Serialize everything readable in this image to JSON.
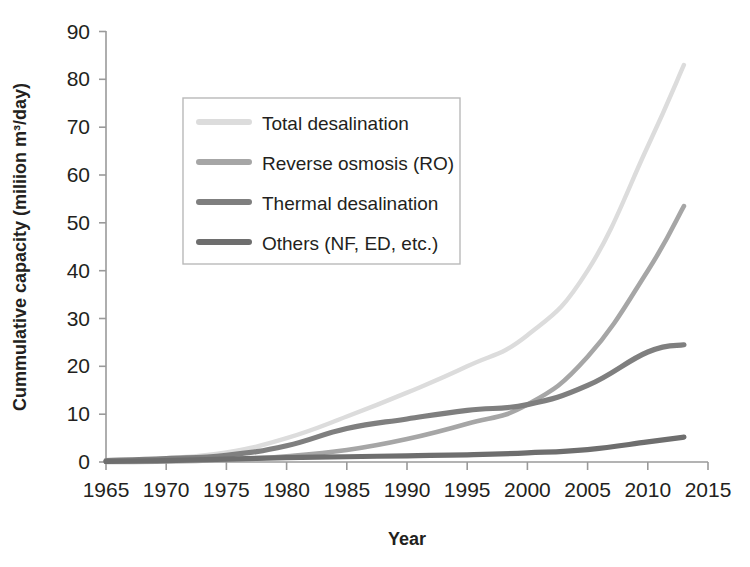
{
  "chart_data": {
    "type": "line",
    "title": "",
    "xlabel": "Year",
    "ylabel": "Cummulative capacity (miliion m³/day)",
    "xlim": [
      1965,
      2015
    ],
    "ylim": [
      0,
      90
    ],
    "x_ticks": [
      "1965",
      "1970",
      "1975",
      "1980",
      "1985",
      "1990",
      "1995",
      "2000",
      "2005",
      "2010",
      "2015"
    ],
    "y_ticks": [
      "0",
      "10",
      "20",
      "30",
      "40",
      "50",
      "60",
      "70",
      "80",
      "90"
    ],
    "grid": false,
    "legend_position": "upper-left-inside",
    "x": [
      1965,
      1970,
      1975,
      1980,
      1985,
      1990,
      1995,
      2000,
      2005,
      2010,
      2013
    ],
    "series": [
      {
        "name": "Total desalination",
        "color": "#dcdcdc",
        "values": [
          0.3,
          0.8,
          2.0,
          5.0,
          9.5,
          14.5,
          20.0,
          26.5,
          40.0,
          66.0,
          83.0
        ]
      },
      {
        "name": "Reverse osmosis (RO)",
        "color": "#a6a6a6",
        "values": [
          0.0,
          0.1,
          0.5,
          1.2,
          2.5,
          4.8,
          8.0,
          12.0,
          22.0,
          40.0,
          53.5
        ]
      },
      {
        "name": "Thermal desalination",
        "color": "#7f7f7f",
        "values": [
          0.3,
          0.7,
          1.4,
          3.4,
          7.0,
          9.0,
          10.8,
          12.0,
          16.0,
          23.0,
          24.5
        ]
      },
      {
        "name": "Others (NF, ED, etc.)",
        "color": "#6e6e6e",
        "values": [
          0.1,
          0.3,
          0.6,
          0.9,
          1.1,
          1.3,
          1.5,
          1.9,
          2.6,
          4.2,
          5.2
        ]
      }
    ]
  },
  "axes": {
    "y_title": "Cummulative capacity (miliion m³/day)",
    "x_title": "Year"
  },
  "legend": {
    "entries": [
      {
        "label": "Total desalination",
        "swatch": "#dcdcdc"
      },
      {
        "label": "Reverse osmosis (RO)",
        "swatch": "#a6a6a6"
      },
      {
        "label": "Thermal desalination",
        "swatch": "#7f7f7f"
      },
      {
        "label": "Others (NF, ED, etc.)",
        "swatch": "#6e6e6e"
      }
    ]
  },
  "y_axis_ticks": {
    "t0": "0",
    "t1": "10",
    "t2": "20",
    "t3": "30",
    "t4": "40",
    "t5": "50",
    "t6": "60",
    "t7": "70",
    "t8": "80",
    "t9": "90"
  },
  "x_axis_ticks": {
    "t0": "1965",
    "t1": "1970",
    "t2": "1975",
    "t3": "1980",
    "t4": "1985",
    "t5": "1990",
    "t6": "1995",
    "t7": "2000",
    "t8": "2005",
    "t9": "2010",
    "t10": "2015"
  }
}
